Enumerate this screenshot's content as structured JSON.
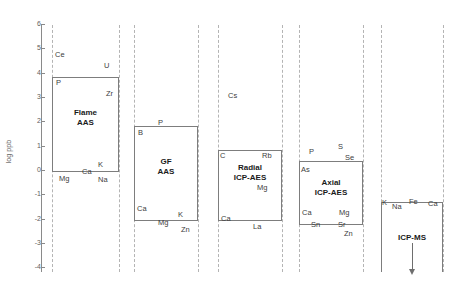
{
  "chart_data": {
    "type": "bar",
    "title": "",
    "subtitle": "",
    "xlabel": "",
    "ylabel": "log ppb",
    "ylim": [
      -4,
      6
    ],
    "grid": false,
    "legend": "none",
    "orientation": "vertical-ranges",
    "y_ticks": [
      6,
      5,
      4,
      3,
      2,
      1,
      0,
      -1,
      -2,
      -3,
      -4
    ],
    "y_tick_labels": [
      "6",
      "5",
      "4",
      "3",
      "2",
      "1",
      "0",
      "-1",
      "-2",
      "-3",
      "-4"
    ],
    "categories": [
      "Flame AAS",
      "GF AAS",
      "Radial ICP-AES",
      "Axial ICP-AES",
      "ICP-MS"
    ],
    "series": [
      {
        "name": "Detection limit range (log ppb)",
        "ranges": [
          {
            "category": "Flame AAS",
            "top": 4.0,
            "bottom": 0.0
          },
          {
            "category": "GF AAS",
            "top": 2.0,
            "bottom": -2.0
          },
          {
            "category": "Radial ICP-AES",
            "top": 1.0,
            "bottom": -2.0
          },
          {
            "category": "Axial ICP-AES",
            "top": 0.5,
            "bottom": -2.2
          },
          {
            "category": "ICP-MS",
            "top": -1.3,
            "bottom": -4.0
          }
        ]
      }
    ],
    "annotations": [
      {
        "element": "Ce",
        "technique": "Flame AAS",
        "log_ppb": 4.9
      },
      {
        "element": "U",
        "technique": "Flame AAS",
        "log_ppb": 4.4
      },
      {
        "element": "P",
        "technique": "Flame AAS",
        "log_ppb": 3.9
      },
      {
        "element": "Zr",
        "technique": "Flame AAS",
        "log_ppb": 3.4
      },
      {
        "element": "K",
        "technique": "Flame AAS",
        "log_ppb": 0.3
      },
      {
        "element": "Ca",
        "technique": "Flame AAS",
        "log_ppb": 0.0
      },
      {
        "element": "Mg",
        "technique": "Flame AAS",
        "log_ppb": -0.3
      },
      {
        "element": "Na",
        "technique": "Flame AAS",
        "log_ppb": -0.3
      },
      {
        "element": "P",
        "technique": "GF AAS",
        "log_ppb": 2.1
      },
      {
        "element": "B",
        "technique": "GF AAS",
        "log_ppb": 1.7
      },
      {
        "element": "Ca",
        "technique": "GF AAS",
        "log_ppb": -1.2
      },
      {
        "element": "K",
        "technique": "GF AAS",
        "log_ppb": -1.7
      },
      {
        "element": "Mg",
        "technique": "GF AAS",
        "log_ppb": -1.9
      },
      {
        "element": "Zn",
        "technique": "GF AAS",
        "log_ppb": -2.2
      },
      {
        "element": "Cs",
        "technique": "Radial ICP-AES",
        "log_ppb": 2.6
      },
      {
        "element": "C",
        "technique": "Radial ICP-AES",
        "log_ppb": 1.1
      },
      {
        "element": "Rb",
        "technique": "Radial ICP-AES",
        "log_ppb": 1.0
      },
      {
        "element": "Mg",
        "technique": "Radial ICP-AES",
        "log_ppb": -0.5
      },
      {
        "element": "Ca",
        "technique": "Radial ICP-AES",
        "log_ppb": -1.9
      },
      {
        "element": "La",
        "technique": "Radial ICP-AES",
        "log_ppb": -2.2
      },
      {
        "element": "S",
        "technique": "Axial ICP-AES",
        "log_ppb": 0.9
      },
      {
        "element": "P",
        "technique": "Axial ICP-AES",
        "log_ppb": 0.7
      },
      {
        "element": "Se",
        "technique": "Axial ICP-AES",
        "log_ppb": 0.5
      },
      {
        "element": "As",
        "technique": "Axial ICP-AES",
        "log_ppb": 0.2
      },
      {
        "element": "Ca",
        "technique": "Axial ICP-AES",
        "log_ppb": -1.6
      },
      {
        "element": "Mg",
        "technique": "Axial ICP-AES",
        "log_ppb": -1.6
      },
      {
        "element": "Sn",
        "technique": "Axial ICP-AES",
        "log_ppb": -2.0
      },
      {
        "element": "Sr",
        "technique": "Axial ICP-AES",
        "log_ppb": -2.0
      },
      {
        "element": "Zn",
        "technique": "Axial ICP-AES",
        "log_ppb": -2.3
      },
      {
        "element": "K",
        "technique": "ICP-MS",
        "log_ppb": -1.2
      },
      {
        "element": "Na",
        "technique": "ICP-MS",
        "log_ppb": -1.4
      },
      {
        "element": "Fe",
        "technique": "ICP-MS",
        "log_ppb": -1.2
      },
      {
        "element": "Ca",
        "technique": "ICP-MS",
        "log_ppb": -1.2
      }
    ]
  },
  "axis": {
    "title": "log ppb",
    "ticks": [
      {
        "label": "6",
        "top": 24
      },
      {
        "label": "5",
        "top": 48
      },
      {
        "label": "4",
        "top": 73
      },
      {
        "label": "3",
        "top": 97
      },
      {
        "label": "2",
        "top": 121
      },
      {
        "label": "1",
        "top": 146
      },
      {
        "label": "0",
        "top": 170
      },
      {
        "label": "-1",
        "top": 194
      },
      {
        "label": "-2",
        "top": 219
      },
      {
        "label": "-3",
        "top": 243
      },
      {
        "label": "-4",
        "top": 267
      }
    ]
  },
  "dividers": [
    52,
    119,
    134,
    198,
    218,
    282,
    299,
    363,
    381,
    443
  ],
  "boxes": [
    {
      "name": "flame-aas",
      "title": "Flame\nAAS",
      "title_line1": "Flame",
      "title_line2": "AAS",
      "left": 52,
      "top": 77,
      "width": 67,
      "height": 95,
      "title_top": 108,
      "open_bottom": false
    },
    {
      "name": "gf-aas",
      "title_line1": "GF",
      "title_line2": "AAS",
      "left": 134,
      "top": 126,
      "width": 64,
      "height": 95,
      "title_top": 157,
      "open_bottom": false
    },
    {
      "name": "radial-icp-aes",
      "title_line1": "Radial",
      "title_line2": "ICP-AES",
      "left": 218,
      "top": 150,
      "width": 64,
      "height": 71,
      "title_top": 163,
      "open_bottom": false
    },
    {
      "name": "axial-icp-aes",
      "title_line1": "Axial",
      "title_line2": "ICP-AES",
      "left": 299,
      "top": 161,
      "width": 64,
      "height": 64,
      "title_top": 178,
      "open_bottom": false
    },
    {
      "name": "icp-ms",
      "title_line1": "ICP-MS",
      "title_line2": "",
      "left": 381,
      "top": 202,
      "width": 62,
      "height": 70,
      "title_top": 233,
      "open_bottom": true
    }
  ],
  "elements": [
    {
      "label": "Ce",
      "left": 55,
      "top": 51
    },
    {
      "label": "U",
      "left": 104,
      "top": 62
    },
    {
      "label": "P",
      "left": 56,
      "top": 79
    },
    {
      "label": "Zr",
      "left": 106,
      "top": 90
    },
    {
      "label": "K",
      "left": 98,
      "top": 161
    },
    {
      "label": "Ca",
      "left": 82,
      "top": 168
    },
    {
      "label": "Mg",
      "left": 59,
      "top": 175
    },
    {
      "label": "Na",
      "left": 98,
      "top": 176
    },
    {
      "label": "P",
      "left": 158,
      "top": 119
    },
    {
      "label": "B",
      "left": 138,
      "top": 129
    },
    {
      "label": "Ca",
      "left": 137,
      "top": 205
    },
    {
      "label": "K",
      "left": 178,
      "top": 211
    },
    {
      "label": "Mg",
      "left": 158,
      "top": 219
    },
    {
      "label": "Zn",
      "left": 181,
      "top": 226
    },
    {
      "label": "Cs",
      "left": 228,
      "top": 92
    },
    {
      "label": "C",
      "left": 220,
      "top": 152
    },
    {
      "label": "Rb",
      "left": 262,
      "top": 152
    },
    {
      "label": "Mg",
      "left": 257,
      "top": 184
    },
    {
      "label": "Ca",
      "left": 221,
      "top": 215
    },
    {
      "label": "La",
      "left": 253,
      "top": 223
    },
    {
      "label": "S",
      "left": 338,
      "top": 143
    },
    {
      "label": "P",
      "left": 309,
      "top": 148
    },
    {
      "label": "Se",
      "left": 345,
      "top": 154
    },
    {
      "label": "As",
      "left": 301,
      "top": 166
    },
    {
      "label": "Ca",
      "left": 302,
      "top": 209
    },
    {
      "label": "Mg",
      "left": 339,
      "top": 209
    },
    {
      "label": "Sn",
      "left": 311,
      "top": 221
    },
    {
      "label": "Sr",
      "left": 338,
      "top": 221
    },
    {
      "label": "Zn",
      "left": 344,
      "top": 230
    },
    {
      "label": "K",
      "left": 382,
      "top": 199
    },
    {
      "label": "Na",
      "left": 392,
      "top": 203
    },
    {
      "label": "Fe",
      "left": 409,
      "top": 198
    },
    {
      "label": "Ca",
      "left": 428,
      "top": 200
    }
  ],
  "arrow": {
    "name": "icp-ms-downward-arrow",
    "left": 412,
    "top": 243,
    "height": 26
  },
  "colors": {
    "box_stroke": "#7d7d7d",
    "divider": "#b4b4b4",
    "axis": "#8a8a8a",
    "text": "#3d3d3d",
    "title_text": "#1a1a1a",
    "background": "#ffffff"
  }
}
